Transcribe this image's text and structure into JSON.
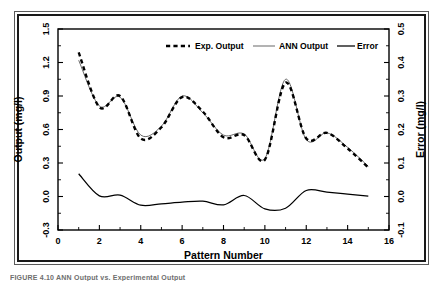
{
  "figure": {
    "caption": "FIGURE 4.10   ANN Output vs. Experimental Output"
  },
  "chart_data": {
    "type": "line",
    "title": "",
    "xlabel": "Pattern Number",
    "ylabel": "Output (mg/l)",
    "y2label": "Error (mg/l)",
    "xlim": [
      0,
      16
    ],
    "ylim": [
      -0.3,
      1.5
    ],
    "y2lim": [
      -0.1,
      0.5
    ],
    "xticks": [
      0,
      2,
      4,
      6,
      8,
      10,
      12,
      14,
      16
    ],
    "xtick_labels": [
      "0",
      "2",
      "4",
      "6",
      "8",
      "10",
      "12",
      "14",
      "16"
    ],
    "yticks": [
      -0.3,
      0.0,
      0.3,
      0.6,
      0.9,
      1.2,
      1.5
    ],
    "ytick_labels": [
      "-0.3",
      "0.0",
      "0.3",
      "0.6",
      "0.9",
      "1.2",
      "1.5"
    ],
    "y2ticks": [
      -0.1,
      0.0,
      0.1,
      0.2,
      0.3,
      0.4,
      0.5
    ],
    "y2tick_labels": [
      "-0.1",
      "0.0",
      "0.1",
      "0.2",
      "0.3",
      "0.4",
      "0.5"
    ],
    "grid": false,
    "legend_position": "top-center",
    "x": [
      1,
      2,
      3,
      4,
      5,
      6,
      7,
      8,
      9,
      10,
      11,
      12,
      13,
      14,
      15
    ],
    "series": [
      {
        "name": "Exp. Output",
        "axis": "left",
        "style": "dashed",
        "values": [
          1.29,
          0.8,
          0.9,
          0.52,
          0.62,
          0.89,
          0.76,
          0.53,
          0.55,
          0.33,
          1.02,
          0.52,
          0.57,
          0.43,
          0.26
        ]
      },
      {
        "name": "ANN Output",
        "axis": "left",
        "style": "thin-solid",
        "values": [
          1.22,
          0.81,
          0.89,
          0.55,
          0.63,
          0.9,
          0.75,
          0.55,
          0.56,
          0.34,
          1.05,
          0.51,
          0.57,
          0.44,
          0.27
        ]
      },
      {
        "name": "Error",
        "axis": "right",
        "style": "solid",
        "values": [
          0.068,
          0.002,
          0.004,
          -0.026,
          -0.022,
          -0.017,
          -0.014,
          -0.025,
          0.003,
          -0.037,
          -0.035,
          0.018,
          0.013,
          0.007,
          0.001
        ]
      }
    ]
  },
  "legend": {
    "items": [
      {
        "label": "Exp. Output"
      },
      {
        "label": "ANN Output"
      },
      {
        "label": "Error"
      }
    ]
  },
  "colors": {
    "exp_output": "#000000",
    "ann_output": "#4d4d4d",
    "error": "#000000",
    "frame": "#1a1a1a",
    "outer_frame": "#5a5a5a"
  }
}
